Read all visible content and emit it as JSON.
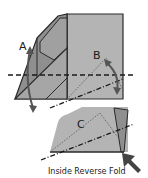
{
  "diagram": {
    "type": "origami-fold-instructions",
    "labels": {
      "step_a": "A",
      "step_b": "B",
      "step_c": "C"
    },
    "caption": "Inside Reverse Fold",
    "colors": {
      "paper_light": "#b4b4b4",
      "paper_dark": "#8f8f8f",
      "paper_mid": "#a6a6a6",
      "outline": "#2a2a2a",
      "background": "#ffffff"
    }
  }
}
